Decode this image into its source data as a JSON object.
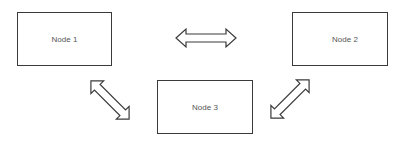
{
  "diagram": {
    "nodes": [
      {
        "id": "node-1",
        "label": "Node 1"
      },
      {
        "id": "node-2",
        "label": "Node 2"
      },
      {
        "id": "node-3",
        "label": "Node 3"
      }
    ],
    "edges": [
      {
        "from": "node-1",
        "to": "node-2",
        "type": "bidirectional"
      },
      {
        "from": "node-1",
        "to": "node-3",
        "type": "bidirectional"
      },
      {
        "from": "node-2",
        "to": "node-3",
        "type": "bidirectional"
      }
    ],
    "colors": {
      "stroke": "#3a3a3a",
      "text": "#555555",
      "background": "#ffffff"
    }
  }
}
